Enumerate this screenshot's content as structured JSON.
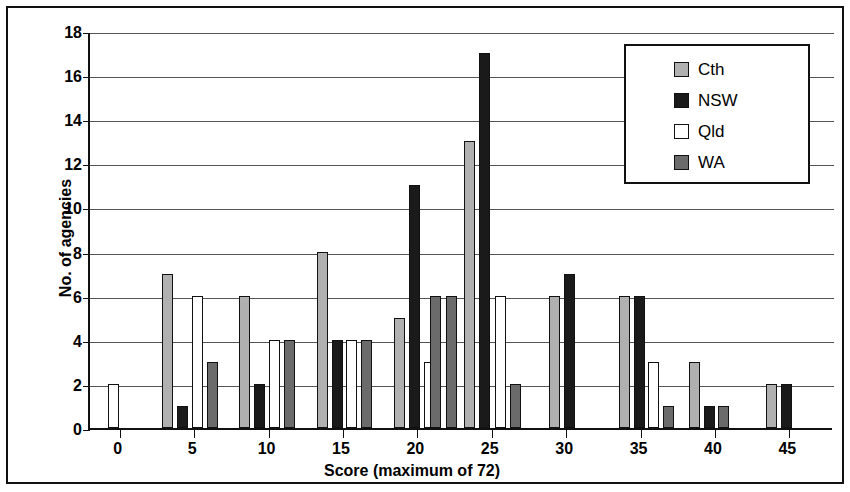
{
  "chart_data": {
    "type": "bar",
    "title": "",
    "subtitle": "",
    "xlabel": "Score (maximum of 72)",
    "ylabel": "No. of agencies",
    "xlim": [
      -2,
      48
    ],
    "ylim": [
      0,
      18
    ],
    "ytick_step": 2,
    "yticks": [
      0,
      2,
      4,
      6,
      8,
      10,
      12,
      14,
      16,
      18
    ],
    "xticks": [
      0,
      5,
      10,
      15,
      20,
      25,
      30,
      35,
      40,
      45
    ],
    "grid": "horizontal",
    "legend_position": "top-right",
    "legend": [
      "Cth",
      "NSW",
      "Qld",
      "WA"
    ],
    "colors": {
      "Cth": "#b0b0b0",
      "NSW": "#1a1a1a",
      "Qld": "#ffffff",
      "WA": "#6b6b6b"
    },
    "series": [
      {
        "name": "Cth",
        "points": [
          {
            "x": 3.2,
            "y": 7
          },
          {
            "x": 8.4,
            "y": 6
          },
          {
            "x": 13.6,
            "y": 8
          },
          {
            "x": 18.8,
            "y": 5
          },
          {
            "x": 23.5,
            "y": 13
          },
          {
            "x": 29.2,
            "y": 6
          },
          {
            "x": 33.9,
            "y": 6
          },
          {
            "x": 38.6,
            "y": 3
          },
          {
            "x": 43.8,
            "y": 2
          }
        ]
      },
      {
        "name": "NSW",
        "points": [
          {
            "x": 4.2,
            "y": 1
          },
          {
            "x": 9.4,
            "y": 2
          },
          {
            "x": 14.6,
            "y": 4
          },
          {
            "x": 19.8,
            "y": 11
          },
          {
            "x": 24.5,
            "y": 17
          },
          {
            "x": 30.2,
            "y": 7
          },
          {
            "x": 34.9,
            "y": 6
          },
          {
            "x": 39.6,
            "y": 1
          },
          {
            "x": 44.8,
            "y": 2
          }
        ]
      },
      {
        "name": "Qld",
        "points": [
          {
            "x": -0.4,
            "y": 2
          },
          {
            "x": 5.2,
            "y": 6
          },
          {
            "x": 10.4,
            "y": 4
          },
          {
            "x": 15.6,
            "y": 4
          },
          {
            "x": 20.8,
            "y": 3
          },
          {
            "x": 25.6,
            "y": 6
          },
          {
            "x": 35.9,
            "y": 3
          }
        ]
      },
      {
        "name": "WA",
        "points": [
          {
            "x": 6.2,
            "y": 3
          },
          {
            "x": 11.4,
            "y": 4
          },
          {
            "x": 16.6,
            "y": 4
          },
          {
            "x": 21.2,
            "y": 6
          },
          {
            "x": 22.3,
            "y": 6
          },
          {
            "x": 26.6,
            "y": 2
          },
          {
            "x": 36.9,
            "y": 1
          },
          {
            "x": 40.6,
            "y": 1
          }
        ]
      }
    ]
  }
}
